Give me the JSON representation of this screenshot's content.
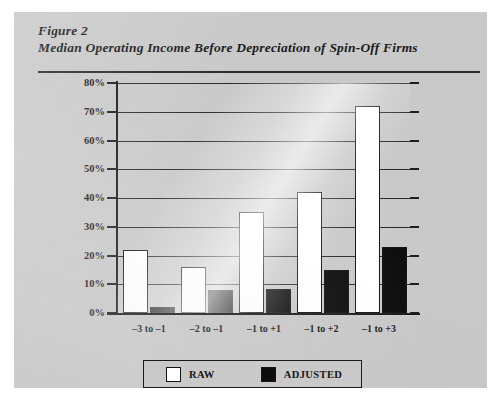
{
  "figure": {
    "label": "Figure 2",
    "title": "Median Operating Income Before Depreciation of Spin-Off Firms"
  },
  "legend": {
    "items": [
      {
        "label": "RAW",
        "color": "#ffffff",
        "swatch": "raw-swatch"
      },
      {
        "label": "ADJUSTED",
        "color": "#0c0c0c",
        "swatch": "adjusted-swatch"
      }
    ]
  },
  "axis": {
    "y_ticks": [
      "80%",
      "70%",
      "60%",
      "50%",
      "40%",
      "30%",
      "20%",
      "10%",
      "0%"
    ]
  },
  "chart_data": {
    "type": "bar",
    "title": "Median Operating Income Before Depreciation of Spin-Off Firms",
    "subtitle": "Figure 2",
    "categories": [
      "–3 to –1",
      "–2 to –1",
      "–1 to +1",
      "–1 to +2",
      "–1 to +3"
    ],
    "series": [
      {
        "name": "RAW",
        "color": "#ffffff",
        "values": [
          22,
          16,
          35,
          42,
          72
        ]
      },
      {
        "name": "ADJUSTED",
        "color": "#0c0c0c",
        "values": [
          2,
          8,
          8.5,
          15,
          23
        ]
      }
    ],
    "xlabel": "",
    "ylabel": "",
    "ylim": [
      0,
      80
    ],
    "ytick_step": 10,
    "ytick_format": "percent",
    "grid": true,
    "legend_position": "bottom"
  }
}
